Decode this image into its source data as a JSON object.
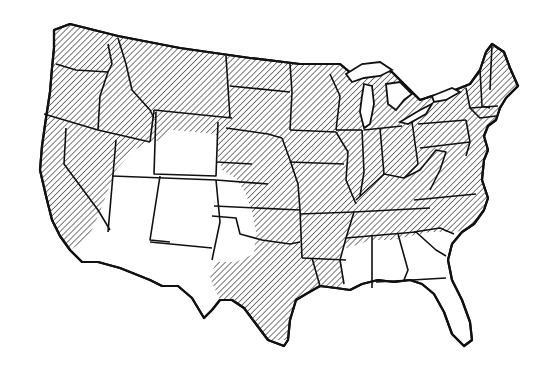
{
  "map": {
    "subject": "Contiguous United States",
    "style": "black outline line drawing with diagonal hatching",
    "colors": {
      "background": "#ffffff",
      "stroke": "#111111",
      "hatch": "#333333"
    },
    "legend": {
      "hatched": "Shaded region",
      "unhatched": "Unshaded region"
    },
    "hatched_states": [
      "WA",
      "OR",
      "CA (northern)",
      "NV (northern)",
      "ID",
      "MT",
      "WY (northern strip)",
      "ND",
      "SD",
      "NE (eastern)",
      "KS (eastern)",
      "OK (eastern)",
      "TX (eastern)",
      "MN",
      "IA",
      "MO",
      "AR",
      "LA (western)",
      "MS (northern)",
      "WI",
      "IL",
      "MI",
      "IN",
      "OH",
      "KY",
      "TN",
      "WV",
      "VA",
      "NC",
      "PA",
      "NY",
      "NJ",
      "DE",
      "MD",
      "CT",
      "RI",
      "MA",
      "VT",
      "NH",
      "ME"
    ],
    "unhatched_states": [
      "CA (southern)",
      "NV (southern)",
      "UT",
      "CO",
      "AZ",
      "NM",
      "WY (most)",
      "TX (western)",
      "OK (panhandle)",
      "KS (western)",
      "NE (western)",
      "LA (eastern)",
      "MS (southern)",
      "AL",
      "GA",
      "SC",
      "FL"
    ]
  }
}
